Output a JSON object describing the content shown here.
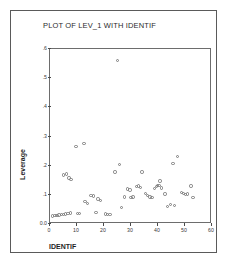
{
  "figure": {
    "title": "PLOT OF LEV_1 WITH IDENTIF",
    "background": "#ffffff",
    "border_color": "#5a5a5a",
    "marker_color": "#7b7b7b"
  },
  "chart_data": {
    "type": "scatter",
    "title": "PLOT OF LEV_1 WITH IDENTIF",
    "xlabel": "IDENTIF",
    "ylabel": "Leverage",
    "xlim": [
      0,
      60
    ],
    "ylim": [
      0.0,
      0.6
    ],
    "grid": false,
    "legend": null,
    "xticks": [
      0,
      10,
      20,
      30,
      40,
      50,
      60
    ],
    "xtick_labels": [
      "0",
      "10",
      "20",
      "30",
      "40",
      "50",
      "60"
    ],
    "yticks": [
      0.0,
      0.1,
      0.2,
      0.3,
      0.4,
      0.5,
      0.6
    ],
    "ytick_labels": [
      "0.0",
      ".1",
      ".2",
      ".3",
      ".4",
      ".5",
      ".6"
    ],
    "marker": "open-circle",
    "series": [
      {
        "name": "Leverage vs IDENTIF",
        "points": [
          [
            1.0,
            0.028
          ],
          [
            1.8,
            0.03
          ],
          [
            2.6,
            0.03
          ],
          [
            3.4,
            0.031
          ],
          [
            4.2,
            0.033
          ],
          [
            5.0,
            0.032
          ],
          [
            5.8,
            0.034
          ],
          [
            6.6,
            0.036
          ],
          [
            7.6,
            0.038
          ],
          [
            5.0,
            0.168
          ],
          [
            6.2,
            0.172
          ],
          [
            7.0,
            0.158
          ],
          [
            7.8,
            0.152
          ],
          [
            9.6,
            0.265
          ],
          [
            10.2,
            0.037
          ],
          [
            10.9,
            0.035
          ],
          [
            12.6,
            0.277
          ],
          [
            13.0,
            0.077
          ],
          [
            13.8,
            0.07
          ],
          [
            15.2,
            0.098
          ],
          [
            16.0,
            0.096
          ],
          [
            17.0,
            0.04
          ],
          [
            17.8,
            0.086
          ],
          [
            18.6,
            0.08
          ],
          [
            20.6,
            0.034
          ],
          [
            21.4,
            0.033
          ],
          [
            22.2,
            0.033
          ],
          [
            24.0,
            0.178
          ],
          [
            25.0,
            0.56
          ],
          [
            25.8,
            0.205
          ],
          [
            26.4,
            0.056
          ],
          [
            27.6,
            0.092
          ],
          [
            28.8,
            0.12
          ],
          [
            29.6,
            0.116
          ],
          [
            30.0,
            0.09
          ],
          [
            30.8,
            0.092
          ],
          [
            32.0,
            0.128
          ],
          [
            32.8,
            0.13
          ],
          [
            33.6,
            0.126
          ],
          [
            34.0,
            0.178
          ],
          [
            35.4,
            0.104
          ],
          [
            36.2,
            0.097
          ],
          [
            37.0,
            0.092
          ],
          [
            37.8,
            0.09
          ],
          [
            38.6,
            0.122
          ],
          [
            39.4,
            0.128
          ],
          [
            39.9,
            0.132
          ],
          [
            40.4,
            0.131
          ],
          [
            40.8,
            0.148
          ],
          [
            41.4,
            0.124
          ],
          [
            42.6,
            0.103
          ],
          [
            43.6,
            0.06
          ],
          [
            44.6,
            0.066
          ],
          [
            45.6,
            0.207
          ],
          [
            46.0,
            0.064
          ],
          [
            47.2,
            0.232
          ],
          [
            48.6,
            0.108
          ],
          [
            49.4,
            0.104
          ],
          [
            50.2,
            0.102
          ],
          [
            51.0,
            0.103
          ],
          [
            52.2,
            0.13
          ],
          [
            53.0,
            0.091
          ]
        ]
      }
    ]
  }
}
